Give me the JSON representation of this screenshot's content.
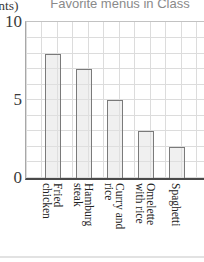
{
  "chart_data": {
    "type": "bar",
    "title": "Favorite menus in Class",
    "y_axis_unit_label": "(Students)",
    "categories": [
      "Fried\nchicken",
      "Hamburg\nsteak",
      "Curry and\nrice",
      "Omelette\nwith rice",
      "Spaghetti"
    ],
    "values": [
      8,
      7,
      5,
      3,
      2
    ],
    "xlabel": "",
    "ylabel": "",
    "ylim": [
      0,
      10
    ],
    "yticks": [
      0,
      5,
      10
    ],
    "grid": true,
    "legend": false,
    "colors": {
      "bar_fill": "#ececec",
      "bar_border": "#7a7a7a",
      "grid_line": "#dcdcdc",
      "axis_line": "#4a4a4a",
      "title_text": "#8a8a8a",
      "tick_text": "#3a3a3a"
    }
  }
}
